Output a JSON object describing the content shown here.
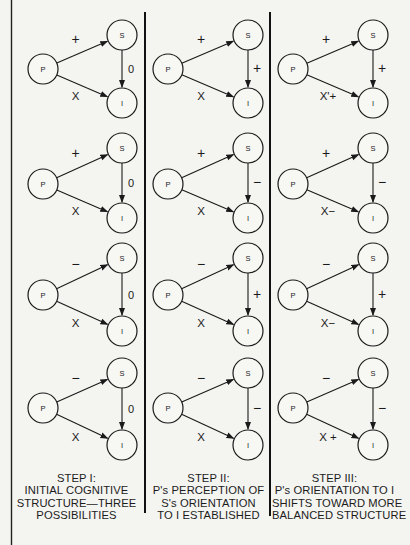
{
  "figure": {
    "background": "#f4f4f1",
    "ink": "#1a1a1a",
    "node_labels": {
      "p": "P",
      "s": "S",
      "i": "I"
    },
    "columns": [
      {
        "step": "STEP I:",
        "caption_lines": [
          "INITIAL COGNITIVE",
          "STRUCTURE—THREE",
          "POSSIBILITIES"
        ],
        "diagrams": [
          {
            "ps": "+",
            "si": "0",
            "pi": "X"
          },
          {
            "ps": "+",
            "si": "0",
            "pi": "X"
          },
          {
            "ps": "−",
            "si": "0",
            "pi": "X"
          },
          {
            "ps": "−",
            "si": "0",
            "pi": "X"
          }
        ]
      },
      {
        "step": "STEP II:",
        "caption_lines": [
          "P's PERCEPTION OF",
          "S's ORIENTATION",
          "TO I ESTABLISHED"
        ],
        "diagrams": [
          {
            "ps": "+",
            "si": "+",
            "pi": "X"
          },
          {
            "ps": "+",
            "si": "−",
            "pi": "X"
          },
          {
            "ps": "−",
            "si": "+",
            "pi": "X"
          },
          {
            "ps": "−",
            "si": "−",
            "pi": "X"
          }
        ]
      },
      {
        "step": "STEP III:",
        "caption_lines": [
          "P's ORIENTATION TO I",
          "SHIFTS TOWARD MORE",
          "BALANCED STRUCTURE"
        ],
        "diagrams": [
          {
            "ps": "+",
            "si": "+",
            "pi": "X'+"
          },
          {
            "ps": "+",
            "si": "−",
            "pi": "X−"
          },
          {
            "ps": "−",
            "si": "+",
            "pi": "X−"
          },
          {
            "ps": "−",
            "si": "−",
            "pi": "X +"
          }
        ]
      }
    ]
  }
}
